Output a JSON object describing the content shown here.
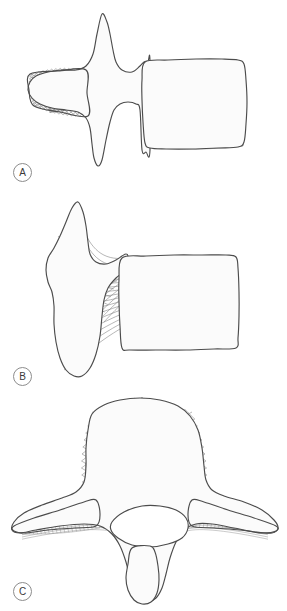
{
  "figure": {
    "background_color": "#ffffff",
    "outline_color": "#4c4c4c",
    "mesh_color": "#6e6e6e",
    "fill_color": "#fbfbfb",
    "label_circle_color": "#8d8d8d",
    "width": 287,
    "height": 611
  },
  "panels": [
    {
      "id": "a",
      "label": "A",
      "view": "lateral",
      "caption": "Vertical and horizontal trabecular systems",
      "parts": [
        {
          "name": "spinous-process",
          "mesh": "none"
        },
        {
          "name": "posterior-element-mesh",
          "mesh": "diagonal-crosshatch"
        },
        {
          "name": "vertebral-body",
          "mesh": "orthogonal-grid"
        }
      ]
    },
    {
      "id": "b",
      "label": "B",
      "view": "lateral",
      "caption": "Oblique trabecular trajectory system",
      "parts": [
        {
          "name": "spinous-process",
          "mesh": "fan-curves"
        },
        {
          "name": "pedicle-region",
          "mesh": "crossing-arcs"
        },
        {
          "name": "vertebral-body",
          "mesh": "fan-arcs"
        }
      ]
    },
    {
      "id": "c",
      "label": "C",
      "view": "axial",
      "caption": "Transverse trabecular trajectory system",
      "parts": [
        {
          "name": "vertebral-body-dome",
          "mesh": "diagonal-crosshatch"
        },
        {
          "name": "left-transverse-process",
          "mesh": "longitudinal-lattice"
        },
        {
          "name": "right-transverse-process",
          "mesh": "longitudinal-lattice"
        },
        {
          "name": "vertebral-foramen",
          "mesh": "none"
        },
        {
          "name": "spinous-process",
          "mesh": "longitudinal-fibers"
        }
      ]
    }
  ],
  "chart_data": {
    "type": "diagram",
    "panel_labels": [
      "A",
      "B",
      "C"
    ],
    "legend": []
  }
}
